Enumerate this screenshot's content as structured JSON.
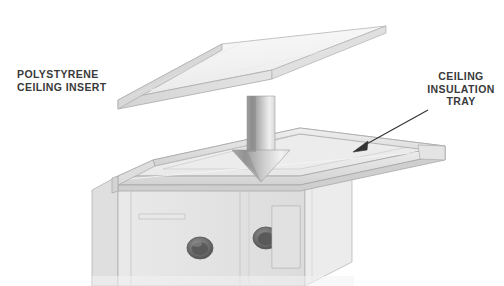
{
  "illustration": {
    "title": "Polystyrene ceiling insert and ceiling insulation tray assembly",
    "width": 504,
    "height": 286,
    "background_color": "#ffffff",
    "view": "isometric exploded assembly line drawing"
  },
  "callouts": [
    {
      "id": "polystyrene-ceiling-insert",
      "text": "POLYSTYRENE\nCEILING INSERT",
      "lines": [
        "POLYSTYRENE",
        "CEILING INSERT"
      ],
      "align": "left",
      "color": "#3a3a3a",
      "has_leader_line": false
    },
    {
      "id": "ceiling-insulation-tray",
      "text": "CEILING\nINSULATION\nTRAY",
      "lines": [
        "CEILING",
        "INSULATION",
        "TRAY"
      ],
      "align": "center",
      "color": "#3a3a3a",
      "has_leader_line": true,
      "leader_arrow_color": "#333333"
    }
  ],
  "parts": [
    {
      "id": "polystyrene-panel",
      "name": "polystyrene ceiling insert panel",
      "description": "thin flat rectangular slab shown in isometric projection above the tray",
      "fill_color": "#f2f2f2",
      "edge_color": "#b4b4b4"
    },
    {
      "id": "assembly-arrow",
      "name": "downward assembly direction arrow",
      "description": "large shaded 3D arrow indicating the panel drops into the tray",
      "fill_color": "#9a9a9a",
      "edge_color": "#6e6e6e"
    },
    {
      "id": "insulation-tray",
      "name": "ceiling insulation tray",
      "description": "shallow open tray with raised rim sitting on top of the cabinet",
      "fill_color": "#ededed",
      "edge_color": "#a8a8a8"
    },
    {
      "id": "cabinet-body",
      "name": "cabinet body below tray",
      "description": "vertical panelled walls cropped by the bottom of the frame",
      "fill_color": "#e6e6e6",
      "edge_color": "#9e9e9e"
    },
    {
      "id": "grommet-left",
      "name": "cable grommet hole left",
      "description": "dark elliptical bushed hole in the front cabinet wall",
      "fill_color": "#6a6a6a"
    },
    {
      "id": "grommet-right",
      "name": "cable grommet hole right",
      "description": "dark elliptical bushed hole partially obscured by a panel edge",
      "fill_color": "#6a6a6a"
    }
  ],
  "colors": {
    "line": "#a0a0a0",
    "line_dark": "#7a7a7a",
    "surface_light": "#fafafa",
    "surface_mid": "#ebebeb",
    "surface_shade": "#d8d8d8",
    "surface_deep": "#c6c6c6",
    "arrow_dark": "#8c8c8c",
    "arrow_light": "#f0f0f0",
    "text": "#3a3a3a",
    "grommet": "#6a6a6a"
  }
}
